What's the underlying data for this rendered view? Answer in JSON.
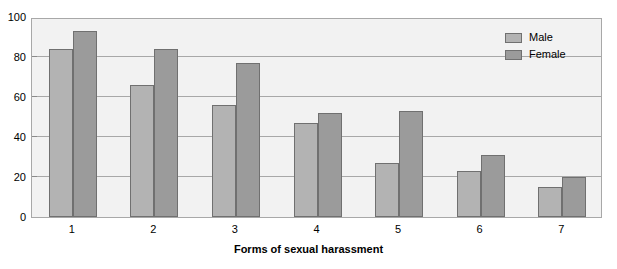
{
  "chart_data": {
    "type": "bar",
    "title": "",
    "xlabel": "Forms of sexual harassment",
    "ylabel": "",
    "categories": [
      "1",
      "2",
      "3",
      "4",
      "5",
      "6",
      "7"
    ],
    "series": [
      {
        "name": "Male",
        "values": [
          84,
          66,
          56,
          47,
          27,
          23,
          15
        ],
        "color": "#b3b3b3"
      },
      {
        "name": "Female",
        "values": [
          93,
          84,
          77,
          52,
          53,
          31,
          20
        ],
        "color": "#9b9b9b"
      }
    ],
    "ylim": [
      0,
      100
    ],
    "yticks": [
      0,
      20,
      40,
      60,
      80,
      100
    ],
    "ytick_labels": [
      "0",
      "20",
      "40",
      "60",
      "80",
      "100"
    ],
    "grid": true,
    "grid_axis": "y",
    "legend_position": "top-right",
    "plot_background": "#f2f2f2",
    "axis_color": "#a8a8a8",
    "bar_edge_color": "#707070"
  },
  "legend": {
    "items": [
      {
        "label": "Male"
      },
      {
        "label": "Female"
      }
    ]
  },
  "axis": {
    "x_title": "Forms of sexual harassment"
  }
}
